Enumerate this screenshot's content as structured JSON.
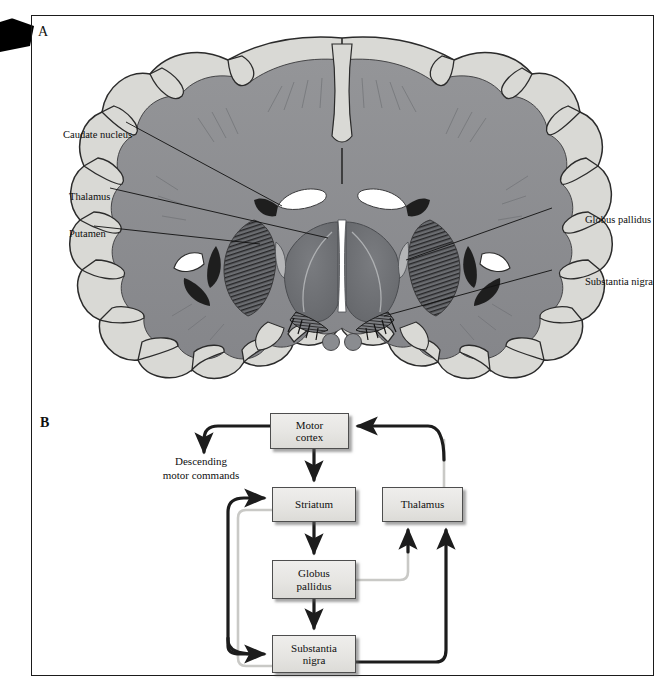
{
  "figure": {
    "panel_a_letter": "A",
    "panel_b_letter": "B"
  },
  "panel_a": {
    "title": "Coronal section of human brain showing basal ganglia",
    "labels": [
      {
        "id": "caudate",
        "text": "Caudate nucleus",
        "side": "left"
      },
      {
        "id": "thalamus",
        "text": "Thalamus",
        "side": "left"
      },
      {
        "id": "putamen",
        "text": "Putamen",
        "side": "left"
      },
      {
        "id": "globus",
        "text": "Globus pallidus",
        "side": "right"
      },
      {
        "id": "nigra",
        "text": "Substantia nigra",
        "side": "right"
      }
    ],
    "colors": {
      "cortex_gray_matter": "#d8d8d4",
      "white_matter": "#8f9093",
      "deep_nuclei": "#6e7073",
      "ventricle": "#ffffff",
      "outline": "#2a2a2a",
      "dark_structure": "#1e1e1e"
    }
  },
  "panel_b": {
    "descending_label": "Descending\nmotor commands",
    "descending_line1": "Descending",
    "descending_line2": "motor commands",
    "nodes": [
      {
        "id": "motor-cortex",
        "line1": "Motor",
        "line2": "cortex"
      },
      {
        "id": "striatum",
        "line1": "Striatum",
        "line2": ""
      },
      {
        "id": "thalamus",
        "line1": "Thalamus",
        "line2": ""
      },
      {
        "id": "globus",
        "line1": "Globus",
        "line2": "pallidus"
      },
      {
        "id": "nigra",
        "line1": "Substantia",
        "line2": "nigra"
      }
    ],
    "edges": [
      {
        "from": "motor-cortex",
        "to": "descending-motor-commands",
        "style": "dark"
      },
      {
        "from": "motor-cortex",
        "to": "striatum",
        "style": "dark"
      },
      {
        "from": "striatum",
        "to": "globus",
        "style": "dark"
      },
      {
        "from": "globus",
        "to": "nigra",
        "style": "dark"
      },
      {
        "from": "globus",
        "to": "thalamus",
        "style": "light"
      },
      {
        "from": "nigra",
        "to": "thalamus",
        "style": "dark"
      },
      {
        "from": "thalamus",
        "to": "motor-cortex",
        "style": "dark"
      },
      {
        "from": "nigra",
        "to": "striatum",
        "style": "dark"
      },
      {
        "from": "striatum",
        "to": "nigra",
        "style": "light"
      }
    ],
    "colors": {
      "box_fill": "#e9e8e5",
      "box_border": "#4e4e4e",
      "arrow_dark": "#1c1c1c",
      "arrow_light": "#c9c9c6",
      "shadow": "#8e8e8e"
    }
  }
}
